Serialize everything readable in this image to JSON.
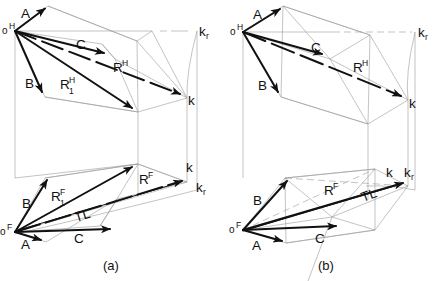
{
  "figure": {
    "background": "#ffffff",
    "ink": "#111111",
    "thin": "#8a8a8a",
    "width": 439,
    "height": 281
  },
  "captions": {
    "a": "(a)",
    "b": "(b)"
  },
  "panel_a": {
    "name": "panel-a",
    "top_view": {
      "name": "h-view",
      "origin_label": "o",
      "origin_sup": "H",
      "vectors": [
        {
          "id": "A",
          "label": "A"
        },
        {
          "id": "B",
          "label": "B"
        },
        {
          "id": "C",
          "label": "C"
        },
        {
          "id": "RH",
          "label": "R",
          "sup": "H"
        },
        {
          "id": "R1H",
          "label": "R",
          "sup": "H",
          "sub": "1"
        }
      ],
      "points": [
        {
          "id": "k",
          "label": "k"
        },
        {
          "id": "kr",
          "label": "k",
          "sub": "r"
        }
      ]
    },
    "front_view": {
      "name": "f-view",
      "origin_label": "o",
      "origin_sup": "F",
      "vectors": [
        {
          "id": "A",
          "label": "A"
        },
        {
          "id": "B",
          "label": "B"
        },
        {
          "id": "C",
          "label": "C"
        },
        {
          "id": "RF",
          "label": "R",
          "sup": "F"
        },
        {
          "id": "R1F",
          "label": "R",
          "sup": "F",
          "sub": "1"
        },
        {
          "id": "TL",
          "label": "TL"
        }
      ],
      "points": [
        {
          "id": "k",
          "label": "k"
        },
        {
          "id": "kr",
          "label": "k",
          "sub": "r"
        }
      ]
    }
  },
  "panel_b": {
    "name": "panel-b",
    "top_view": {
      "name": "h-view",
      "origin_label": "o",
      "origin_sup": "H",
      "vectors": [
        {
          "id": "A",
          "label": "A"
        },
        {
          "id": "B",
          "label": "B"
        },
        {
          "id": "C",
          "label": "C"
        },
        {
          "id": "RH",
          "label": "R",
          "sup": "H"
        }
      ],
      "points": [
        {
          "id": "k",
          "label": "k"
        },
        {
          "id": "kr",
          "label": "k",
          "sub": "r"
        }
      ]
    },
    "front_view": {
      "name": "f-view",
      "origin_label": "o",
      "origin_sup": "F",
      "vectors": [
        {
          "id": "A",
          "label": "A"
        },
        {
          "id": "B",
          "label": "B"
        },
        {
          "id": "C",
          "label": "C"
        },
        {
          "id": "RF",
          "label": "R",
          "sup": "F"
        },
        {
          "id": "TL",
          "label": "TL"
        }
      ],
      "points": [
        {
          "id": "k",
          "label": "k"
        },
        {
          "id": "kr",
          "label": "k",
          "sub": "r"
        }
      ]
    }
  },
  "labels": {
    "A": "A",
    "B": "B",
    "C": "C",
    "R": "R",
    "TL": "TL",
    "k": "k",
    "o": "o",
    "sup_H": "H",
    "sup_F": "F",
    "sub_1": "1",
    "sub_r": "r"
  }
}
